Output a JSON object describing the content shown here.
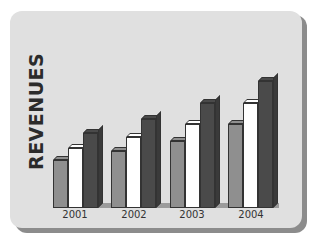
{
  "chart_data": {
    "type": "bar",
    "title": "",
    "xlabel": "",
    "ylabel": "REVENUES",
    "categories": [
      "2001",
      "2002",
      "2003",
      "2004"
    ],
    "series": [
      {
        "name": "Series 1",
        "color": "#8f8f8f",
        "values": [
          48,
          57,
          67,
          84
        ]
      },
      {
        "name": "Series 2",
        "color": "#ffffff",
        "values": [
          60,
          71,
          84,
          105
        ]
      },
      {
        "name": "Series 3",
        "color": "#4a4a4a",
        "values": [
          75,
          89,
          105,
          127
        ]
      }
    ],
    "style": "3d-clustered",
    "grid": false,
    "legend": "none",
    "ylim": [
      0,
      140
    ]
  }
}
